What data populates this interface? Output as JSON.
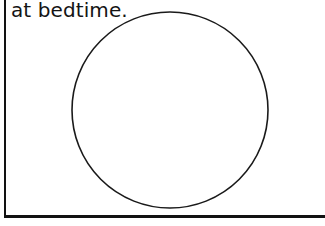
{
  "page": {
    "width": 325,
    "height": 226,
    "background_color": "#ffffff",
    "ink_color": "#121212"
  },
  "caption": {
    "text": "at bedtime.",
    "color": "#141414",
    "font_size_px": 20
  },
  "rules": {
    "left_rule": {
      "name": "left-margin-rule",
      "orientation": "vertical",
      "x": 4,
      "y": 0,
      "length": 217,
      "thickness": 2,
      "color": "#121212"
    },
    "bottom_rule": {
      "name": "bottom-border-rule",
      "orientation": "horizontal",
      "x": 4,
      "y": 215,
      "length": 321,
      "thickness": 3,
      "color": "#121212"
    }
  },
  "shapes": {
    "circle": {
      "name": "answer-circle",
      "center_x": 170,
      "center_y": 110,
      "radius": 98,
      "stroke_color": "#1a1a1a",
      "stroke_width": 1.6,
      "fill": "none",
      "style": "hand-drawn"
    }
  }
}
